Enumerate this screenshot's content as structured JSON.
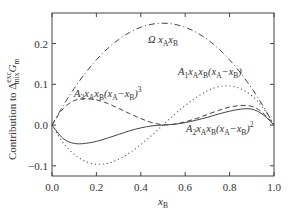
{
  "chart_data": {
    "type": "line",
    "title": "",
    "xlabel": "x_B",
    "ylabel": "Contribution to Δ_mix^exc G_m",
    "xlim": [
      0.0,
      1.0
    ],
    "ylim": [
      -0.125,
      0.275
    ],
    "grid": false,
    "legend": "inline labels",
    "x_ticks": [
      "0.0",
      "0.2",
      "0.4",
      "0.6",
      "0.8",
      "1.0"
    ],
    "y_ticks": [
      "-0.1",
      "0.0",
      "0.1",
      "0.2"
    ],
    "series": [
      {
        "name": "Ω x_A x_B",
        "style": "dash-dot",
        "x": [
          0.0,
          0.05,
          0.1,
          0.15,
          0.2,
          0.25,
          0.3,
          0.35,
          0.4,
          0.45,
          0.5,
          0.55,
          0.6,
          0.65,
          0.7,
          0.75,
          0.8,
          0.85,
          0.9,
          0.95,
          1.0
        ],
        "values": [
          0.0,
          0.0475,
          0.09,
          0.1275,
          0.16,
          0.1875,
          0.21,
          0.2275,
          0.24,
          0.2475,
          0.25,
          0.2475,
          0.24,
          0.2275,
          0.21,
          0.1875,
          0.16,
          0.1275,
          0.09,
          0.0475,
          0.0
        ]
      },
      {
        "name": "A_1 x_A x_B (x_A − x_B)",
        "style": "dotted",
        "x": [
          0.0,
          0.05,
          0.1,
          0.15,
          0.2,
          0.25,
          0.3,
          0.35,
          0.4,
          0.45,
          0.5,
          0.55,
          0.6,
          0.65,
          0.7,
          0.75,
          0.8,
          0.85,
          0.9,
          0.95,
          1.0
        ],
        "values": [
          0.0,
          -0.043,
          -0.072,
          -0.089,
          -0.096,
          -0.094,
          -0.084,
          -0.068,
          -0.048,
          -0.025,
          0.0,
          0.025,
          0.048,
          0.068,
          0.084,
          0.094,
          0.096,
          0.089,
          0.072,
          0.043,
          0.0
        ]
      },
      {
        "name": "A_2 x_A x_B (x_A − x_B)^2",
        "style": "solid",
        "x": [
          0.0,
          0.05,
          0.1,
          0.15,
          0.2,
          0.25,
          0.3,
          0.35,
          0.4,
          0.45,
          0.5,
          0.55,
          0.6,
          0.65,
          0.7,
          0.75,
          0.8,
          0.85,
          0.9,
          0.95,
          1.0
        ],
        "values": [
          0.0,
          -0.033,
          -0.045,
          -0.045,
          -0.04,
          -0.032,
          -0.023,
          -0.014,
          -0.007,
          -0.002,
          0.0,
          0.002,
          0.006,
          0.012,
          0.019,
          0.027,
          0.034,
          0.039,
          0.039,
          0.026,
          0.0
        ]
      },
      {
        "name": "A_3 x_A x_B (x_A − x_B)^3",
        "style": "dashed",
        "x": [
          0.0,
          0.05,
          0.1,
          0.15,
          0.2,
          0.25,
          0.3,
          0.35,
          0.4,
          0.45,
          0.5,
          0.55,
          0.6,
          0.65,
          0.7,
          0.75,
          0.8,
          0.85,
          0.9,
          0.95,
          1.0
        ],
        "values": [
          0.0,
          0.04,
          0.06,
          0.065,
          0.062,
          0.053,
          0.041,
          0.028,
          0.016,
          0.006,
          0.001,
          0.002,
          0.008,
          0.016,
          0.026,
          0.036,
          0.044,
          0.048,
          0.046,
          0.03,
          0.0
        ]
      }
    ],
    "annotations": [
      {
        "text": "Ω x_A x_B",
        "x": 0.42,
        "y": 0.205
      },
      {
        "text": "A_1 x_A x_B (x_A − x_B)",
        "x": 0.6,
        "y": 0.112
      },
      {
        "text": "A_3 x_A x_B (x_A − x_B)^3",
        "x": 0.05,
        "y": 0.075
      },
      {
        "text": "A_2 x_A x_B (x_A − x_B)^2",
        "x": 0.65,
        "y": -0.008
      }
    ]
  },
  "labels": {
    "xlabel_main": "x",
    "xlabel_sub": "B",
    "ylabel": "Contribution to Δ",
    "ylabel_sup": "exc",
    "ylabel_sub": "mix",
    "ylabel_tail": "G",
    "ylabel_tail_sub": "m",
    "omega": {
      "pre": "Ω x",
      "s1": "A",
      "m": "x",
      "s2": "B"
    },
    "a1": {
      "p0": "A",
      "s0": "1",
      "p1": "x",
      "s1": "A",
      "p2": "x",
      "s2": "B",
      "p3": "(x",
      "s3": "A",
      "p4": "−x",
      "s4": "B",
      "p5": ")"
    },
    "a2": {
      "p0": "A",
      "s0": "2",
      "p1": "x",
      "s1": "A",
      "p2": "x",
      "s2": "B",
      "p3": "(x",
      "s3": "A",
      "p4": "−x",
      "s4": "B",
      "p5": ")",
      "sup": "2"
    },
    "a3": {
      "p0": "A",
      "s0": "3",
      "p1": "x",
      "s1": "A",
      "p2": "x",
      "s2": "B",
      "p3": "(x",
      "s3": "A",
      "p4": "−x",
      "s4": "B",
      "p5": ")",
      "sup": "3"
    }
  },
  "colors": {
    "axis": "#444444",
    "curve": "#444444",
    "text": "#333333",
    "background": "#ffffff"
  }
}
